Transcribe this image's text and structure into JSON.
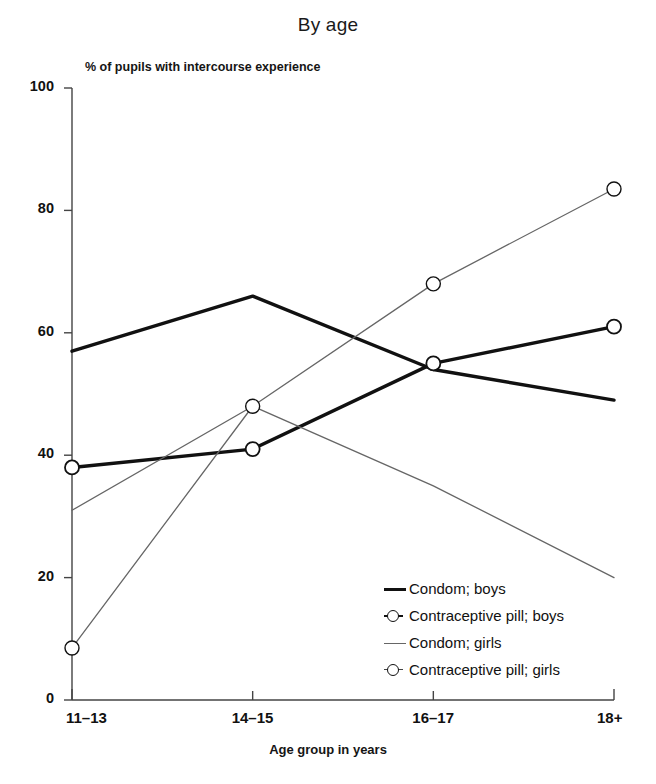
{
  "chart_data": {
    "type": "line",
    "title": "By age",
    "xlabel": "Age group in years",
    "ylabel": "% of pupils with intercourse experience",
    "categories": [
      "11–13",
      "14–15",
      "16–17",
      "18+"
    ],
    "ylim": [
      0,
      100
    ],
    "yticks": [
      0,
      20,
      40,
      60,
      80,
      100
    ],
    "ytick_labels": [
      "0",
      "20",
      "40",
      "60",
      "80",
      "100"
    ],
    "grid": false,
    "legend_position": "inside lower-right",
    "series": [
      {
        "name": "Condom; boys",
        "values": [
          57,
          66,
          54,
          49
        ],
        "style": "thick-line",
        "marker": "none",
        "color": "#111111"
      },
      {
        "name": "Contraceptive pill; boys",
        "values": [
          38,
          41,
          55,
          61
        ],
        "style": "thick-line",
        "marker": "circle",
        "color": "#111111"
      },
      {
        "name": "Condom; girls",
        "values": [
          31,
          48,
          35,
          20
        ],
        "style": "thin-line",
        "marker": "none",
        "color": "#666666"
      },
      {
        "name": "Contraceptive pill; girls",
        "values": [
          8.5,
          48,
          68,
          83.5
        ],
        "style": "thin-line",
        "marker": "circle",
        "color": "#666666"
      }
    ]
  },
  "legend": {
    "items": [
      {
        "label": "Condom; boys"
      },
      {
        "label": "Contraceptive pill; boys"
      },
      {
        "label": "Condom; girls"
      },
      {
        "label": "Contraceptive pill; girls"
      }
    ]
  }
}
